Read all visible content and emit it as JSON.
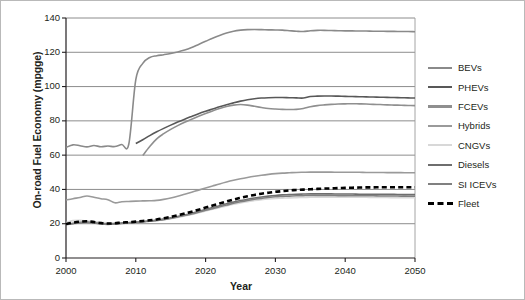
{
  "chart_data": {
    "type": "line",
    "title": "",
    "xlabel": "Year",
    "ylabel": "On-road Fuel Economy (mpgge)",
    "xlim": [
      2000,
      2050
    ],
    "ylim": [
      0,
      140
    ],
    "xticks": [
      "2000",
      "2010",
      "2020",
      "2030",
      "2040",
      "2050"
    ],
    "yticks": [
      "0",
      "20",
      "40",
      "60",
      "80",
      "100",
      "120",
      "140"
    ],
    "grid": "horizontal",
    "legend_position": "right",
    "x": [
      2000,
      2001,
      2002,
      2003,
      2004,
      2005,
      2006,
      2007,
      2008,
      2009,
      2010,
      2011,
      2012,
      2013,
      2014,
      2015,
      2016,
      2017,
      2018,
      2019,
      2020,
      2021,
      2022,
      2023,
      2024,
      2025,
      2026,
      2027,
      2028,
      2029,
      2030,
      2031,
      2032,
      2033,
      2034,
      2035,
      2036,
      2037,
      2038,
      2039,
      2040,
      2041,
      2042,
      2043,
      2044,
      2045,
      2046,
      2047,
      2048,
      2049,
      2050
    ],
    "series": [
      {
        "name": "BEVs",
        "color": "#8a8a8a",
        "style": "solid",
        "values": [
          64.5,
          66.0,
          65.5,
          64.8,
          65.6,
          64.9,
          65.3,
          65.0,
          66.2,
          66.5,
          104.0,
          113.5,
          117.0,
          118.0,
          118.6,
          119.3,
          120.2,
          121.3,
          122.8,
          124.6,
          126.4,
          128.2,
          129.8,
          131.2,
          132.3,
          132.9,
          133.2,
          133.3,
          133.2,
          133.1,
          133.0,
          132.9,
          132.6,
          132.3,
          132.1,
          132.6,
          132.8,
          132.8,
          132.7,
          132.6,
          132.5,
          132.5,
          132.4,
          132.4,
          132.3,
          132.3,
          132.2,
          132.2,
          132.1,
          132.1,
          132.0
        ]
      },
      {
        "name": "PHEVs",
        "color": "#585858",
        "style": "solid",
        "start_year": 2010,
        "values": [
          null,
          null,
          null,
          null,
          null,
          null,
          null,
          null,
          null,
          null,
          66.8,
          69.0,
          71.4,
          73.6,
          75.6,
          77.5,
          79.3,
          81.0,
          82.6,
          84.2,
          85.6,
          86.9,
          88.2,
          89.4,
          90.5,
          91.5,
          92.3,
          92.9,
          93.3,
          93.5,
          93.6,
          93.6,
          93.5,
          93.4,
          93.3,
          94.2,
          94.4,
          94.5,
          94.5,
          94.4,
          94.3,
          94.2,
          94.1,
          94.0,
          93.9,
          93.8,
          93.7,
          93.6,
          93.5,
          93.4,
          93.3
        ]
      },
      {
        "name": "FCEVs",
        "color": "#8f8f8f",
        "style": "solid",
        "start_year": 2011,
        "values": [
          null,
          null,
          null,
          null,
          null,
          null,
          null,
          null,
          null,
          null,
          null,
          59.8,
          65.0,
          69.5,
          72.5,
          75.0,
          77.2,
          79.2,
          81.0,
          82.7,
          84.3,
          85.8,
          87.2,
          88.4,
          89.2,
          89.5,
          89.2,
          88.5,
          87.8,
          87.2,
          86.9,
          86.7,
          86.6,
          86.7,
          87.2,
          88.2,
          88.9,
          89.3,
          89.6,
          89.8,
          89.9,
          90.0,
          89.9,
          89.8,
          89.6,
          89.5,
          89.3,
          89.2,
          89.1,
          89.0,
          88.9
        ]
      },
      {
        "name": "Hybrids",
        "color": "#9a9a9a",
        "style": "solid",
        "values": [
          33.8,
          34.6,
          35.3,
          36.2,
          35.4,
          34.6,
          34.0,
          32.2,
          32.8,
          33.0,
          33.2,
          33.3,
          33.4,
          33.6,
          34.2,
          35.0,
          36.0,
          37.2,
          38.4,
          39.6,
          40.8,
          42.0,
          43.2,
          44.3,
          45.3,
          46.2,
          47.0,
          47.7,
          48.3,
          48.8,
          49.2,
          49.5,
          49.7,
          49.9,
          50.0,
          50.1,
          50.1,
          50.1,
          50.1,
          50.0,
          50.0,
          50.0,
          50.0,
          49.9,
          49.9,
          49.9,
          49.8,
          49.8,
          49.8,
          49.7,
          49.7
        ]
      },
      {
        "name": "CNGVs",
        "color": "#d8d8d8",
        "style": "solid",
        "values": [
          20.6,
          21.8,
          22.0,
          21.6,
          21.2,
          20.8,
          20.6,
          20.5,
          20.6,
          20.8,
          21.0,
          21.2,
          21.5,
          21.9,
          22.4,
          23.0,
          23.7,
          24.5,
          25.4,
          26.4,
          27.4,
          28.4,
          29.4,
          30.4,
          31.3,
          32.1,
          32.9,
          33.5,
          34.0,
          34.4,
          34.7,
          34.9,
          35.1,
          35.2,
          35.3,
          35.4,
          35.5,
          35.5,
          35.5,
          35.5,
          35.5,
          35.4,
          35.4,
          35.4,
          35.3,
          35.3,
          35.3,
          35.2,
          35.2,
          35.2,
          35.1
        ]
      },
      {
        "name": "Diesels",
        "color": "#6e6e6e",
        "style": "solid",
        "values": [
          19.6,
          20.2,
          20.8,
          21.0,
          20.6,
          20.0,
          19.8,
          20.0,
          20.4,
          20.6,
          20.9,
          21.2,
          21.6,
          22.1,
          22.7,
          23.4,
          24.2,
          25.1,
          26.1,
          27.2,
          28.3,
          29.4,
          30.5,
          31.6,
          32.6,
          33.5,
          34.3,
          35.0,
          35.6,
          36.1,
          36.5,
          36.8,
          37.0,
          37.2,
          37.3,
          37.4,
          37.4,
          37.4,
          37.4,
          37.3,
          37.3,
          37.3,
          37.2,
          37.2,
          37.2,
          37.1,
          37.1,
          37.1,
          37.0,
          37.0,
          37.0
        ]
      },
      {
        "name": "SI ICEVs",
        "color": "#808080",
        "style": "solid",
        "values": [
          19.4,
          20.0,
          20.5,
          20.7,
          20.4,
          19.8,
          19.6,
          19.8,
          20.2,
          20.4,
          20.7,
          21.0,
          21.4,
          21.9,
          22.4,
          23.1,
          23.9,
          24.8,
          25.7,
          26.7,
          27.8,
          28.8,
          29.9,
          30.9,
          31.9,
          32.8,
          33.6,
          34.3,
          34.8,
          35.3,
          35.7,
          35.9,
          36.1,
          36.3,
          36.4,
          36.5,
          36.5,
          36.5,
          36.5,
          36.4,
          36.4,
          36.4,
          36.3,
          36.3,
          36.3,
          36.2,
          36.2,
          36.2,
          36.1,
          36.1,
          36.1
        ]
      },
      {
        "name": "Fleet",
        "color": "#000000",
        "style": "dashed",
        "values": [
          19.8,
          20.6,
          21.2,
          21.4,
          21.0,
          20.4,
          20.1,
          20.3,
          20.7,
          20.9,
          21.2,
          21.6,
          22.0,
          22.5,
          23.2,
          24.0,
          24.9,
          25.9,
          27.0,
          28.2,
          29.4,
          30.6,
          31.8,
          33.0,
          34.1,
          35.1,
          36.0,
          36.8,
          37.5,
          38.1,
          38.6,
          39.0,
          39.4,
          39.7,
          39.9,
          40.1,
          40.3,
          40.5,
          40.6,
          40.8,
          40.9,
          41.0,
          41.1,
          41.2,
          41.2,
          41.3,
          41.3,
          41.3,
          41.3,
          41.3,
          41.3
        ]
      }
    ]
  },
  "legend": {
    "items": [
      {
        "label": "BEVs",
        "color": "#8a8a8a",
        "style": "solid"
      },
      {
        "label": "PHEVs",
        "color": "#585858",
        "style": "solid"
      },
      {
        "label": "FCEVs",
        "color": "#8f8f8f",
        "style": "solid"
      },
      {
        "label": "Hybrids",
        "color": "#9a9a9a",
        "style": "solid"
      },
      {
        "label": "CNGVs",
        "color": "#d8d8d8",
        "style": "solid"
      },
      {
        "label": "Diesels",
        "color": "#6e6e6e",
        "style": "solid"
      },
      {
        "label": "SI ICEVs",
        "color": "#808080",
        "style": "solid"
      },
      {
        "label": "Fleet",
        "color": "#000000",
        "style": "dashed"
      }
    ]
  }
}
